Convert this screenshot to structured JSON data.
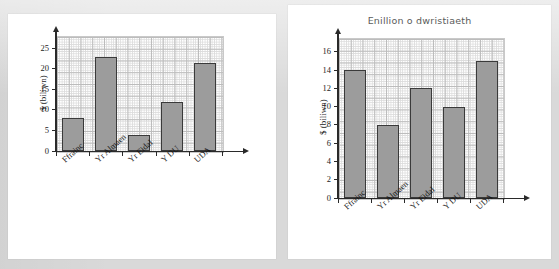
{
  "page": {
    "background_color": "#d9d9d9",
    "panel_color": "#ffffff"
  },
  "style": {
    "bar_fill": "#9c9c9c",
    "bar_stroke": "#3a3a3a",
    "axis_color": "#2a2a2a",
    "grid_minor": "#dcdcdc",
    "grid_major": "#bcbcbc",
    "title_color": "#5b5b5b"
  },
  "charts": [
    {
      "id": "gwariant",
      "title": "Gwariant ar dwristiaeth",
      "ylabel": "$ (biliwn)",
      "categories": [
        "Ffrainc",
        "Yr Almaen",
        "Yr Eidal",
        "Y DU",
        "UDA"
      ],
      "values": [
        8,
        23,
        4,
        12,
        21.5
      ],
      "yticks": [
        0,
        5,
        10,
        15,
        20,
        25
      ],
      "ytick_labels": [
        "0",
        "5",
        "10",
        "15",
        "20",
        "25"
      ],
      "ylim": [
        0,
        28
      ]
    },
    {
      "id": "enillion",
      "title": "Enillion o dwristiaeth",
      "ylabel": "$ (biliwn)",
      "categories": [
        "Ffrainc",
        "Yr Almaen",
        "Yr Eidal",
        "Y DU",
        "UDA"
      ],
      "values": [
        14,
        8,
        12,
        10,
        15
      ],
      "yticks": [
        0,
        2,
        4,
        6,
        8,
        10,
        12,
        14,
        16
      ],
      "ytick_labels": [
        "0",
        "2",
        "4",
        "6",
        "8",
        "10",
        "12",
        "14",
        "16"
      ],
      "ylim": [
        0,
        17.5
      ]
    }
  ],
  "chart_data": [
    {
      "type": "bar",
      "title": "Gwariant ar dwristiaeth",
      "xlabel": "",
      "ylabel": "$ (biliwn)",
      "categories": [
        "Ffrainc",
        "Yr Almaen",
        "Yr Eidal",
        "Y DU",
        "UDA"
      ],
      "values": [
        8,
        23,
        4,
        12,
        21.5
      ],
      "ylim": [
        0,
        28
      ],
      "yticks": [
        0,
        5,
        10,
        15,
        20,
        25
      ],
      "grid": true,
      "legend": "none"
    },
    {
      "type": "bar",
      "title": "Enillion o dwristiaeth",
      "xlabel": "",
      "ylabel": "$ (biliwn)",
      "categories": [
        "Ffrainc",
        "Yr Almaen",
        "Yr Eidal",
        "Y DU",
        "UDA"
      ],
      "values": [
        14,
        8,
        12,
        10,
        15
      ],
      "ylim": [
        0,
        17.5
      ],
      "yticks": [
        0,
        2,
        4,
        6,
        8,
        10,
        12,
        14,
        16
      ],
      "grid": true,
      "legend": "none"
    }
  ]
}
